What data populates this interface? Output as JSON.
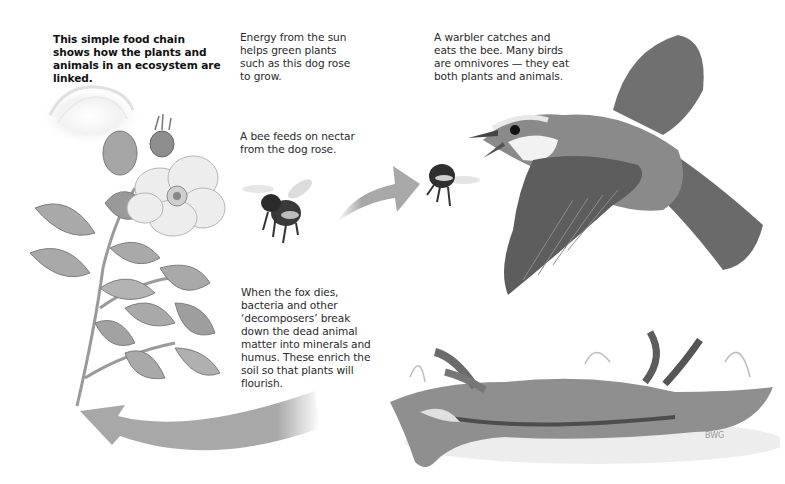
{
  "diagram": {
    "type": "food-chain",
    "intro": "This simple food chain shows how the plants and animals in an ecosystem are linked.",
    "captions": {
      "sun_plant": "Energy from the sun helps green plants such as this dog rose to grow.",
      "bee": "A bee feeds on nectar from the dog rose.",
      "warbler": "A warbler catches and eats the bee. Many birds are omnivores — they eat both plants and animals.",
      "fox": "When the fox dies, bacteria and other ‘decomposers’ break down the dead animal matter into minerals and humus. These enrich the soil so that plants will flourish."
    },
    "nodes": [
      {
        "id": "sun",
        "label": "sun"
      },
      {
        "id": "dog-rose",
        "label": "dog rose"
      },
      {
        "id": "bee",
        "label": "bee"
      },
      {
        "id": "warbler",
        "label": "warbler"
      },
      {
        "id": "fox",
        "label": "dead fox"
      }
    ],
    "edges": [
      {
        "from": "bee",
        "to": "warbler",
        "style": "gray arrow"
      },
      {
        "from": "fox",
        "to": "dog-rose",
        "style": "curved gray arrow"
      }
    ],
    "signature": "BWG",
    "colors": {
      "arrow": "#a8a8a8",
      "text": "#222222",
      "background": "#ffffff"
    }
  }
}
